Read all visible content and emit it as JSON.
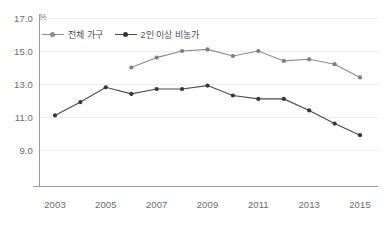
{
  "title": "",
  "unit": "%",
  "legend": {
    "items": [
      {
        "label": "전체 가구",
        "color": "#8c8c91",
        "icon": "line-marker-icon"
      },
      {
        "label": "2인 이상 비농가",
        "color": "#4a4a4f",
        "icon": "line-marker-icon"
      }
    ]
  },
  "axes": {
    "y_ticks": [
      "9.0",
      "11.0",
      "13.0",
      "15.0",
      "17.0"
    ],
    "x_ticks": [
      "2003",
      "2005",
      "2007",
      "2009",
      "2011",
      "2013",
      "2015"
    ]
  },
  "chart_data": {
    "type": "line",
    "title": "",
    "xlabel": "",
    "ylabel": "%",
    "ylim": [
      9.0,
      17.0
    ],
    "xlim": [
      2003,
      2015
    ],
    "grid": true,
    "legend_position": "top-left",
    "x": [
      2003,
      2004,
      2005,
      2006,
      2007,
      2008,
      2009,
      2010,
      2011,
      2012,
      2013,
      2014,
      2015
    ],
    "series": [
      {
        "name": "전체 가구",
        "color": "#8c8c91",
        "x": [
          2006,
          2007,
          2008,
          2009,
          2010,
          2011,
          2012,
          2013,
          2014,
          2015
        ],
        "values": [
          14.0,
          14.6,
          15.0,
          15.1,
          14.7,
          15.0,
          14.4,
          14.5,
          14.2,
          13.4
        ]
      },
      {
        "name": "2인 이상 비농가",
        "color": "#4a4a4f",
        "x": [
          2003,
          2004,
          2005,
          2006,
          2007,
          2008,
          2009,
          2010,
          2011,
          2012,
          2013,
          2014,
          2015
        ],
        "values": [
          11.1,
          11.9,
          12.8,
          12.4,
          12.7,
          12.7,
          12.9,
          12.3,
          12.1,
          12.1,
          11.4,
          10.6,
          9.9
        ]
      }
    ]
  }
}
